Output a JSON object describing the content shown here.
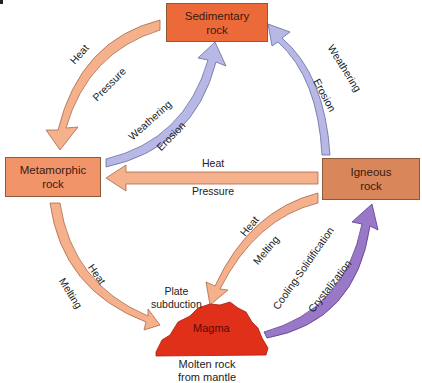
{
  "diagram": {
    "colors": {
      "sedimentary_box": "#ec6a3a",
      "metamorphic_box": "#f2946a",
      "igneous_box": "#d9875a",
      "magma": "#e0301a",
      "heat_arrow": "#f5b08c",
      "weathering_arrow": "#b8b8e6",
      "cooling_arrow": "#9a78c8"
    },
    "nodes": {
      "sedimentary": "Sedimentary\nrock",
      "metamorphic": "Metamorphic\nrock",
      "igneous": "Igneous\nrock",
      "magma": "Magma",
      "magma_caption": "Molten rock\nfrom mantle"
    },
    "arrows": {
      "sed_to_met": {
        "label_outer": "Heat",
        "label_inner": "Pressure"
      },
      "met_to_sed": {
        "label_outer": "Weathering",
        "label_inner": "Erosion"
      },
      "ign_to_sed": {
        "label_outer": "Weathering",
        "label_inner": "Erosion"
      },
      "ign_to_met": {
        "label_top": "Heat",
        "label_bottom": "Pressure"
      },
      "met_to_magma": {
        "label_outer": "Melting",
        "label_inner": "Heat"
      },
      "ign_to_magma": {
        "label_outer": "Heat",
        "label_inner": "Melting"
      },
      "magma_to_ign": {
        "label_outer": "Cooling-Solidification",
        "label_inner": "Crystalization"
      },
      "plate_subduction": "Plate\nsubduction"
    }
  }
}
